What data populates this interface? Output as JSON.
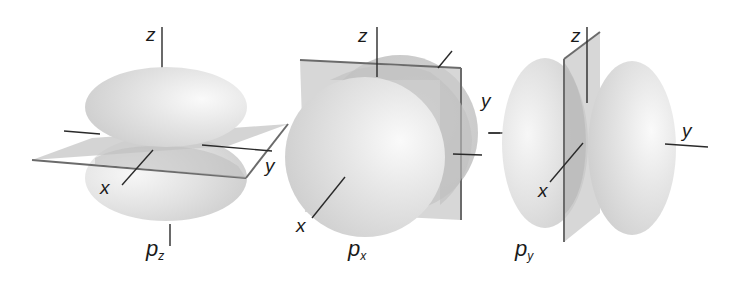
{
  "figure": {
    "panels": [
      {
        "id": "pz",
        "name": "p",
        "subscript": "z",
        "axes": {
          "z": "z",
          "x": "x",
          "y": "y"
        },
        "nodal_plane": "xy"
      },
      {
        "id": "px",
        "name": "p",
        "subscript": "x",
        "axes": {
          "z": "z",
          "x": "x",
          "y": "y"
        },
        "nodal_plane": "yz"
      },
      {
        "id": "py",
        "name": "p",
        "subscript": "y",
        "axes": {
          "z": "z",
          "x": "x",
          "y": "y"
        },
        "nodal_plane": "xz"
      }
    ]
  },
  "colors": {
    "lobe_light": "#f4f4f4",
    "lobe_mid": "#dcdcdc",
    "lobe_dark": "#c4c4c4",
    "plane_fill": "#c9c9c9",
    "plane_edge": "#6b6b6b",
    "axis": "#2a2a2a"
  }
}
